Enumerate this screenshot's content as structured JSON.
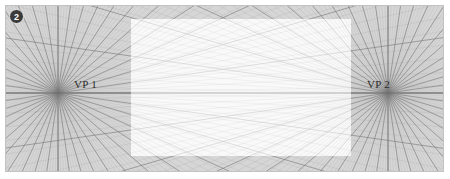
{
  "figure": {
    "step_number": "2",
    "background_color": "#d6d6d6",
    "highlight_color": "#ffffff",
    "line_color": "#8d8d8d",
    "border_color": "#c2c2c2",
    "canvas": {
      "x": 5,
      "y": 5,
      "width": 439,
      "height": 167
    }
  },
  "vanishing_points": [
    {
      "id": "vp1",
      "label": "VP 1",
      "x": 52,
      "y": 87
    },
    {
      "id": "vp2",
      "label": "VP 2",
      "x": 382,
      "y": 87
    }
  ],
  "horizon": {
    "y": 87,
    "label": "horizon-line"
  },
  "highlight_box": {
    "x": 125,
    "y": 13,
    "width": 220,
    "height": 137
  },
  "chart_data": {
    "type": "scatter",
    "xlabel": "",
    "ylabel": "",
    "xlim": [
      0,
      439
    ],
    "ylim": [
      0,
      167
    ],
    "grid": true,
    "legend": "none",
    "annotations": [
      "VP 1",
      "VP 2",
      "2"
    ],
    "series": [
      {
        "name": "rays-from-vp1",
        "count": 44,
        "origin_x": 52,
        "origin_y": 87
      },
      {
        "name": "rays-from-vp2",
        "count": 44,
        "origin_x": 382,
        "origin_y": 87
      },
      {
        "name": "horizon",
        "count": 1,
        "origin_x": 0,
        "origin_y": 87
      }
    ]
  }
}
